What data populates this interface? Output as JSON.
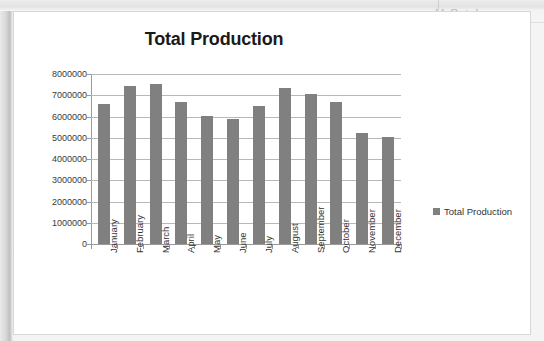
{
  "background": {
    "artifact_text": "11  Octob",
    "panel_color": "#ffffff"
  },
  "chart_data": {
    "type": "bar",
    "title": "Total Production",
    "xlabel": "",
    "ylabel": "",
    "categories": [
      "January",
      "February",
      "March",
      "April",
      "May",
      "June",
      "July",
      "August",
      "September",
      "October",
      "November",
      "December"
    ],
    "values": [
      6600000,
      7450000,
      7550000,
      6700000,
      6020000,
      5880000,
      6480000,
      7330000,
      7050000,
      6680000,
      5220000,
      5050000
    ],
    "series": [
      {
        "name": "Total Production",
        "values": [
          6600000,
          7450000,
          7550000,
          6700000,
          6020000,
          5880000,
          6480000,
          7330000,
          7050000,
          6680000,
          5220000,
          5050000
        ],
        "color": "#808080"
      }
    ],
    "ylim": [
      0,
      8000000
    ],
    "ytick_labels": [
      "8000000",
      "7000000",
      "6000000",
      "5000000",
      "4000000",
      "3000000",
      "2000000",
      "1000000",
      "0"
    ],
    "ytick_values": [
      8000000,
      7000000,
      6000000,
      5000000,
      4000000,
      3000000,
      2000000,
      1000000,
      0
    ],
    "grid": true,
    "legend": {
      "position": "right",
      "entries": [
        {
          "label": "Total Production",
          "color": "#808080"
        }
      ]
    }
  }
}
